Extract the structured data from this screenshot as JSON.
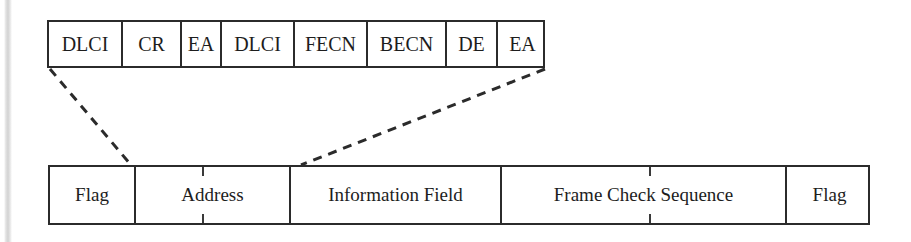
{
  "figure": {
    "line_color": "#2b2b2b",
    "text_color": "#1d1d1d",
    "background": "#ffffff"
  },
  "address_detail_row": {
    "name": "address-field-expansion",
    "cells": [
      {
        "label": "DLCI",
        "x": 0,
        "width": 72
      },
      {
        "label": "CR",
        "x": 72,
        "width": 59
      },
      {
        "label": "EA",
        "x": 131,
        "width": 40
      },
      {
        "label": "DLCI",
        "x": 171,
        "width": 73
      },
      {
        "label": "FECN",
        "x": 244,
        "width": 73
      },
      {
        "label": "BECN",
        "x": 317,
        "width": 79
      },
      {
        "label": "DE",
        "x": 396,
        "width": 51
      },
      {
        "label": "EA",
        "x": 447,
        "width": 51
      }
    ]
  },
  "frame_row": {
    "name": "frame-format",
    "cells": [
      {
        "label": "Flag",
        "x": 0,
        "width": 84,
        "ticks": []
      },
      {
        "label": "Address",
        "x": 84,
        "width": 155,
        "ticks": [
          66
        ]
      },
      {
        "label": "Information Field",
        "x": 239,
        "width": 211,
        "ticks": []
      },
      {
        "label": "Frame Check Sequence",
        "x": 450,
        "width": 285,
        "ticks": [
          147
        ]
      },
      {
        "label": "Flag",
        "x": 735,
        "width": 87,
        "ticks": []
      }
    ]
  },
  "connectors": [
    {
      "name": "address-left-connector",
      "x1": 50,
      "y1": 69,
      "x2": 131,
      "y2": 165
    },
    {
      "name": "address-right-connector",
      "x1": 545,
      "y1": 69,
      "x2": 301,
      "y2": 165
    }
  ]
}
